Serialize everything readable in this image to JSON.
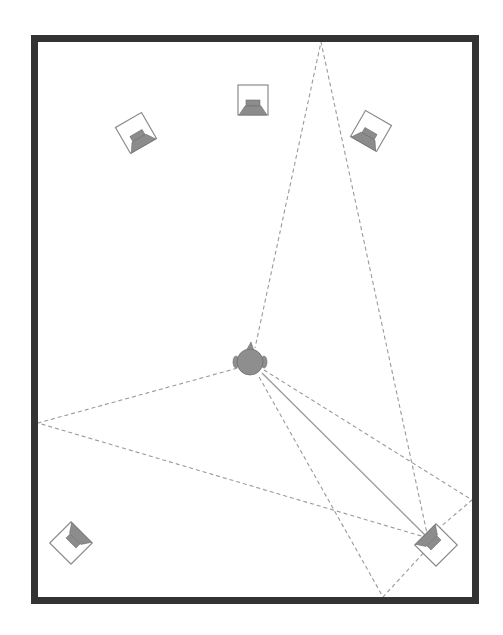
{
  "diagram": {
    "title": "",
    "type": "surround-speaker-room-layout",
    "colors": {
      "wall": "#333333",
      "speaker_box": "#8a8a8a",
      "speaker_cone": "#8c8c8c",
      "listener": "#8e8e8e",
      "path": "#9a9a9a",
      "background": "#ffffff"
    },
    "room": {
      "x": 34.5,
      "y": 38.5,
      "width": 441,
      "height": 562,
      "wall_width": 7
    },
    "listener": {
      "x": 250,
      "y": 362,
      "radius": 13,
      "label": "listener-head"
    },
    "speakers": [
      {
        "id": "front-left",
        "x": 136,
        "y": 133,
        "rotation": -30
      },
      {
        "id": "center",
        "x": 253,
        "y": 100,
        "rotation": 0
      },
      {
        "id": "front-right",
        "x": 371,
        "y": 131,
        "rotation": 30
      },
      {
        "id": "rear-left",
        "x": 71,
        "y": 543,
        "rotation": -135
      },
      {
        "id": "rear-right",
        "x": 436,
        "y": 545,
        "rotation": 135
      }
    ],
    "direct_path": {
      "from": [
        262,
        373
      ],
      "to": [
        428,
        538
      ],
      "style": "solid"
    },
    "reflection_points": [
      {
        "wall": "top",
        "x": 321,
        "y": 42
      },
      {
        "wall": "left",
        "x": 38,
        "y": 423
      },
      {
        "wall": "right",
        "x": 472,
        "y": 500
      },
      {
        "wall": "bottom",
        "x": 383,
        "y": 597
      }
    ],
    "reflected_paths": [
      {
        "from": [
          428,
          538
        ],
        "via": [
          321,
          42
        ],
        "to": [
          255,
          348
        ]
      },
      {
        "from": [
          428,
          538
        ],
        "via": [
          38,
          423
        ],
        "to": [
          238,
          368
        ]
      },
      {
        "from": [
          432,
          534
        ],
        "via": [
          472,
          500
        ],
        "to": [
          264,
          370
        ]
      },
      {
        "from": [
          428,
          548
        ],
        "via": [
          383,
          597
        ],
        "to": [
          258,
          375
        ]
      }
    ]
  }
}
